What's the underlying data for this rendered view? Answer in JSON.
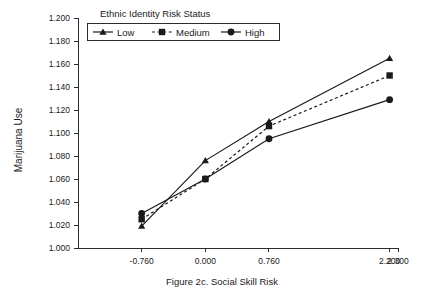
{
  "chart_data": {
    "type": "line",
    "title": "",
    "caption": "Figure 2c. Social Skill Risk",
    "xlabel": "Figure 2c. Social Skill Risk",
    "ylabel": "Marijuana Use",
    "legend_title": "Ethnic Identity Risk Status",
    "legend_position": "top",
    "grid": false,
    "x": [
      -0.76,
      0.0,
      0.76,
      2.2
    ],
    "xlim": [
      -1.52,
      2.3
    ],
    "ylim": [
      1.0,
      1.2
    ],
    "xticks": [
      -0.76,
      0.0,
      0.76,
      2.2,
      2.3
    ],
    "xtick_labels": [
      "-0.760",
      "0.000",
      "0.760",
      "2.200",
      "2.300"
    ],
    "yticks": [
      1.0,
      1.02,
      1.04,
      1.06,
      1.08,
      1.1,
      1.12,
      1.14,
      1.16,
      1.18,
      1.2
    ],
    "ytick_labels": [
      "1.000",
      "1.020",
      "1.040",
      "1.060",
      "1.080",
      "1.100",
      "1.120",
      "1.140",
      "1.160",
      "1.180",
      "1.200"
    ],
    "series": [
      {
        "name": "Low",
        "marker": "triangle",
        "line_style": "solid",
        "color": "#1a1a1a",
        "values": [
          1.019,
          1.076,
          1.11,
          1.165
        ]
      },
      {
        "name": "Medium",
        "marker": "square",
        "line_style": "dotted",
        "color": "#1a1a1a",
        "values": [
          1.025,
          1.06,
          1.106,
          1.15
        ]
      },
      {
        "name": "High",
        "marker": "circle",
        "line_style": "solid",
        "color": "#1a1a1a",
        "values": [
          1.03,
          1.06,
          1.095,
          1.129
        ]
      }
    ]
  },
  "legend": {
    "title": "Ethnic Identity Risk Status",
    "entries": [
      {
        "label": "Low",
        "marker": "triangle-icon"
      },
      {
        "label": "Medium",
        "marker": "square-icon"
      },
      {
        "label": "High",
        "marker": "circle-icon"
      }
    ]
  },
  "axes": {
    "y_title": "Marijuana Use",
    "x_caption": "Figure 2c. Social Skill Risk"
  },
  "colors": {
    "ink": "#1a1a1a",
    "axis": "#2b2b2b",
    "background": "#ffffff"
  }
}
